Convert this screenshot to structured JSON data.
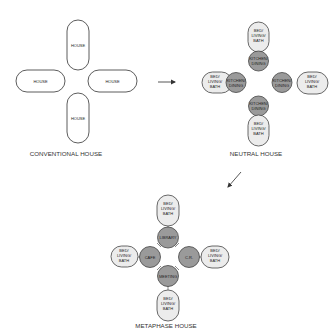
{
  "diagram": {
    "conventional": {
      "title": "CONVENTIONAL HOUSE",
      "units": [
        {
          "label": "HOUSE",
          "position": "top"
        },
        {
          "label": "HOUSE",
          "position": "left"
        },
        {
          "label": "HOUSE",
          "position": "right"
        },
        {
          "label": "HOUSE",
          "position": "bottom"
        }
      ]
    },
    "neutral": {
      "title": "NEUTRAL HOUSE",
      "private_label": [
        "BED/",
        "LIVING/",
        "BATH"
      ],
      "shared_label": [
        "KITCHEN/",
        "DINING"
      ]
    },
    "metaphase": {
      "title": "METAPHASE HOUSE",
      "private_label": [
        "BED/",
        "LIVING/",
        "BATH"
      ],
      "shared": {
        "top": "LIBRARY",
        "left": "CAFE",
        "right": "C.R.",
        "bottom": "MEETING"
      }
    },
    "arrows": [
      {
        "from": "conventional",
        "to": "neutral",
        "direction": "right"
      },
      {
        "from": "neutral",
        "to": "metaphase",
        "direction": "down-left"
      }
    ],
    "colors": {
      "shared_fill": "#9a9a9a",
      "private_fill": "#ececec",
      "stroke": "#444444"
    }
  }
}
